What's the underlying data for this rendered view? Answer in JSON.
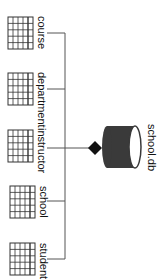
{
  "diagram": {
    "database": {
      "label": "school.db",
      "icon": "database-cylinder-icon",
      "color": "#3a3a3a"
    },
    "connector": {
      "icon": "aggregation-diamond-icon",
      "color": "#111111"
    },
    "tables": [
      {
        "label": "course",
        "icon": "table-grid-icon"
      },
      {
        "label": "department",
        "icon": "table-grid-icon"
      },
      {
        "label": "instructor",
        "icon": "table-grid-icon"
      },
      {
        "label": "school",
        "icon": "table-grid-icon"
      },
      {
        "label": "student",
        "icon": "table-grid-icon"
      }
    ],
    "line_color": "#555555"
  }
}
